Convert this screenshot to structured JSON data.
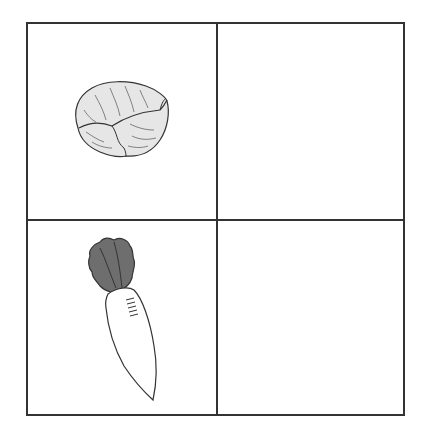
{
  "grid": {
    "rows": 2,
    "columns": 2,
    "border_color": "#333333",
    "cells": [
      {
        "row": 1,
        "col": 1,
        "content": "cabbage"
      },
      {
        "row": 1,
        "col": 2,
        "content": ""
      },
      {
        "row": 2,
        "col": 1,
        "content": "radish"
      },
      {
        "row": 2,
        "col": 2,
        "content": ""
      }
    ]
  },
  "colors": {
    "cabbage_fill": "#e6e6e6",
    "radish_leaves": "#6e6e6e",
    "radish_body": "#ffffff",
    "outline": "#333333"
  }
}
